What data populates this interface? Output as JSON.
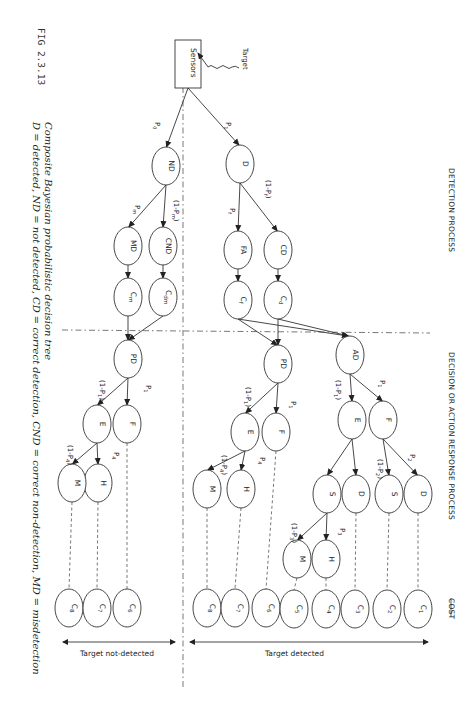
{
  "figure": {
    "number": "FIG 2.3.13",
    "caption_line1": "Composite Bayesian probabilistic decision tree",
    "caption_line2": "D = detected, ND = not detected, CD = correct detection, CND = correct non-detection, MD = misdetection"
  },
  "headers": {
    "detection": "DETECTION PROCESS",
    "decision": "DECISION OR ACTION RESPONSE PROCESS",
    "cost": "COST"
  },
  "source": {
    "label": "Sensors",
    "target_label": "Target"
  },
  "bottom": {
    "not_detected": "Target not-detected",
    "detected": "Target detected"
  },
  "nodes": [
    {
      "id": "ND",
      "label": "ND",
      "x": 166,
      "y": 166
    },
    {
      "id": "D",
      "label": "D",
      "x": 240,
      "y": 164
    },
    {
      "id": "CND",
      "label": "CND",
      "x": 163,
      "y": 246
    },
    {
      "id": "MD",
      "label": "MD",
      "x": 128,
      "y": 246
    },
    {
      "id": "Cdm",
      "label": "Cdm",
      "x": 163,
      "y": 297
    },
    {
      "id": "Cm",
      "label": "Cm",
      "x": 128,
      "y": 297
    },
    {
      "id": "FA",
      "label": "FA",
      "x": 238,
      "y": 250
    },
    {
      "id": "CD",
      "label": "CD",
      "x": 278,
      "y": 250
    },
    {
      "id": "Cf",
      "label": "Cf",
      "x": 238,
      "y": 300
    },
    {
      "id": "Cd",
      "label": "Cd",
      "x": 278,
      "y": 300
    },
    {
      "id": "PD1",
      "label": "PD",
      "x": 128,
      "y": 359
    },
    {
      "id": "PD2",
      "label": "PD",
      "x": 278,
      "y": 364
    },
    {
      "id": "AD",
      "label": "AD",
      "x": 350,
      "y": 355
    },
    {
      "id": "F_l",
      "label": "F",
      "x": 127,
      "y": 424
    },
    {
      "id": "E_l",
      "label": "E",
      "x": 97,
      "y": 424
    },
    {
      "id": "F_m",
      "label": "F",
      "x": 276,
      "y": 432
    },
    {
      "id": "E_m",
      "label": "E",
      "x": 245,
      "y": 432
    },
    {
      "id": "E_r",
      "label": "E",
      "x": 352,
      "y": 420
    },
    {
      "id": "F_r",
      "label": "F",
      "x": 383,
      "y": 420
    },
    {
      "id": "H_l",
      "label": "H",
      "x": 98,
      "y": 483
    },
    {
      "id": "M_l",
      "label": "M",
      "x": 72,
      "y": 483
    },
    {
      "id": "H_m",
      "label": "H",
      "x": 241,
      "y": 489
    },
    {
      "id": "M_m",
      "label": "M",
      "x": 207,
      "y": 489
    },
    {
      "id": "S_r",
      "label": "S",
      "x": 327,
      "y": 494
    },
    {
      "id": "D_r",
      "label": "D",
      "x": 356,
      "y": 494
    },
    {
      "id": "S_rr",
      "label": "S",
      "x": 389,
      "y": 494
    },
    {
      "id": "D_rr",
      "label": "D",
      "x": 418,
      "y": 494
    },
    {
      "id": "H_r",
      "label": "H",
      "x": 326,
      "y": 559
    },
    {
      "id": "M_r",
      "label": "M",
      "x": 297,
      "y": 559
    }
  ],
  "costs": [
    {
      "label": "C8",
      "x": 69,
      "y": 608
    },
    {
      "label": "C7",
      "x": 97,
      "y": 608
    },
    {
      "label": "C6",
      "x": 127,
      "y": 608
    },
    {
      "label": "C8",
      "x": 207,
      "y": 608
    },
    {
      "label": "C7",
      "x": 235,
      "y": 608
    },
    {
      "label": "C6",
      "x": 266,
      "y": 608
    },
    {
      "label": "C5",
      "x": 294,
      "y": 609
    },
    {
      "label": "C4",
      "x": 326,
      "y": 609
    },
    {
      "label": "C3",
      "x": 355,
      "y": 609
    },
    {
      "label": "C2",
      "x": 387,
      "y": 609
    },
    {
      "label": "C1",
      "x": 418,
      "y": 609
    }
  ],
  "probabilities": [
    {
      "text": "P0",
      "x": 155,
      "y": 122
    },
    {
      "text": "P1",
      "x": 226,
      "y": 122
    },
    {
      "text": "(1-Pm)",
      "x": 174,
      "y": 200
    },
    {
      "text": "Pm",
      "x": 135,
      "y": 205
    },
    {
      "text": "(1-Pf)",
      "x": 266,
      "y": 180
    },
    {
      "text": "Pf",
      "x": 230,
      "y": 208
    },
    {
      "text": "P1",
      "x": 146,
      "y": 385
    },
    {
      "text": "(1-P1)",
      "x": 100,
      "y": 380
    },
    {
      "text": "P1",
      "x": 291,
      "y": 401
    },
    {
      "text": "(1-P1)",
      "x": 246,
      "y": 387
    },
    {
      "text": "P1",
      "x": 380,
      "y": 380
    },
    {
      "text": "(1-P1)",
      "x": 336,
      "y": 380
    },
    {
      "text": "P4",
      "x": 114,
      "y": 452
    },
    {
      "text": "(1-P4)",
      "x": 68,
      "y": 445
    },
    {
      "text": "P4",
      "x": 260,
      "y": 457
    },
    {
      "text": "(1-P4)",
      "x": 222,
      "y": 455
    },
    {
      "text": "P2",
      "x": 410,
      "y": 454
    },
    {
      "text": "(1-P2)",
      "x": 378,
      "y": 459
    },
    {
      "text": "P3",
      "x": 340,
      "y": 528
    },
    {
      "text": "(1-P3)",
      "x": 292,
      "y": 523
    }
  ]
}
